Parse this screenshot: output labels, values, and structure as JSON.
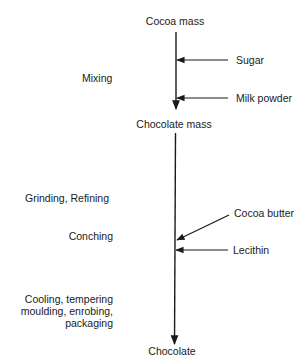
{
  "diagram": {
    "type": "process-flow",
    "nodes": {
      "start": "Cocoa mass",
      "intermediate": "Chocolate mass",
      "end": "Chocolate"
    },
    "inputs": [
      {
        "label": "Sugar",
        "joins": "Cocoa mass → Chocolate mass"
      },
      {
        "label": "Milk powder",
        "joins": "Cocoa mass → Chocolate mass"
      },
      {
        "label": "Cocoa butter",
        "joins": "Chocolate mass → Chocolate"
      },
      {
        "label": "Lecithin",
        "joins": "Chocolate mass → Chocolate"
      }
    ],
    "steps": [
      {
        "label": "Mixing"
      },
      {
        "label": "Grinding, Refining"
      },
      {
        "label": "Conching"
      },
      {
        "label_lines": [
          "Cooling, tempering",
          "moulding, enrobing,",
          "packaging"
        ]
      }
    ],
    "line_color": "#1a1a1a"
  }
}
